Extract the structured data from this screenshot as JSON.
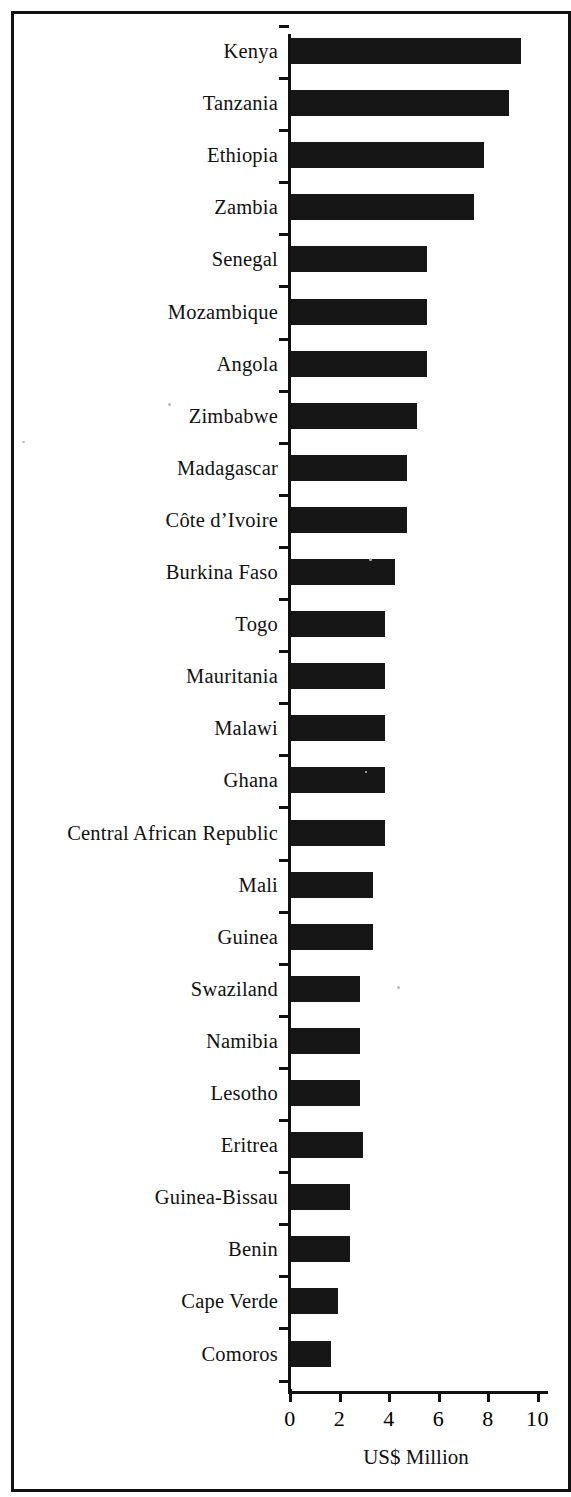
{
  "figure": {
    "axis_title": "US$ Million",
    "axis_color": "#111111",
    "bar_color": "#161616"
  },
  "chart_data": {
    "type": "bar",
    "orientation": "horizontal",
    "title": "",
    "subtitle": "",
    "xlabel": "US$ Million",
    "ylabel": "",
    "xlim": [
      0,
      10
    ],
    "xticks": [
      0,
      2,
      4,
      6,
      8,
      10
    ],
    "xtick_labels": [
      "0",
      "2",
      "4",
      "6",
      "8",
      "10"
    ],
    "grid": false,
    "legend": null,
    "note": "Rightmost tick label '10' is clipped by the image edge.",
    "categories": [
      "Kenya",
      "Tanzania",
      "Ethiopia",
      "Zambia",
      "Senegal",
      "Mozambique",
      "Angola",
      "Zimbabwe",
      "Madagascar",
      "Côte d’Ivoire",
      "Burkina Faso",
      "Togo",
      "Mauritania",
      "Malawi",
      "Ghana",
      "Central African Republic",
      "Mali",
      "Guinea",
      "Swaziland",
      "Namibia",
      "Lesotho",
      "Eritrea",
      "Guinea-Bissau",
      "Benin",
      "Cape Verde",
      "Comoros"
    ],
    "values": [
      9.3,
      8.8,
      7.8,
      7.4,
      5.5,
      5.5,
      5.5,
      5.1,
      4.7,
      4.7,
      4.2,
      3.8,
      3.8,
      3.8,
      3.8,
      3.8,
      3.3,
      3.3,
      2.8,
      2.8,
      2.8,
      2.9,
      2.4,
      2.4,
      1.9,
      1.6
    ]
  }
}
